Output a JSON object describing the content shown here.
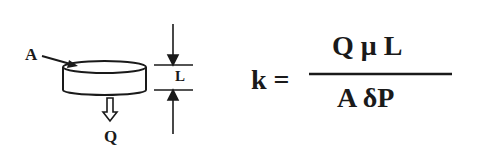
{
  "diagram": {
    "sample": {
      "area_label": "A",
      "flow_label": "Q",
      "length_label": "L"
    },
    "equation": {
      "lhs": "k =",
      "numerator": "Q μ L",
      "denominator": "A δP"
    },
    "colors": {
      "ink": "#1a1a1a",
      "background": "#ffffff"
    }
  }
}
